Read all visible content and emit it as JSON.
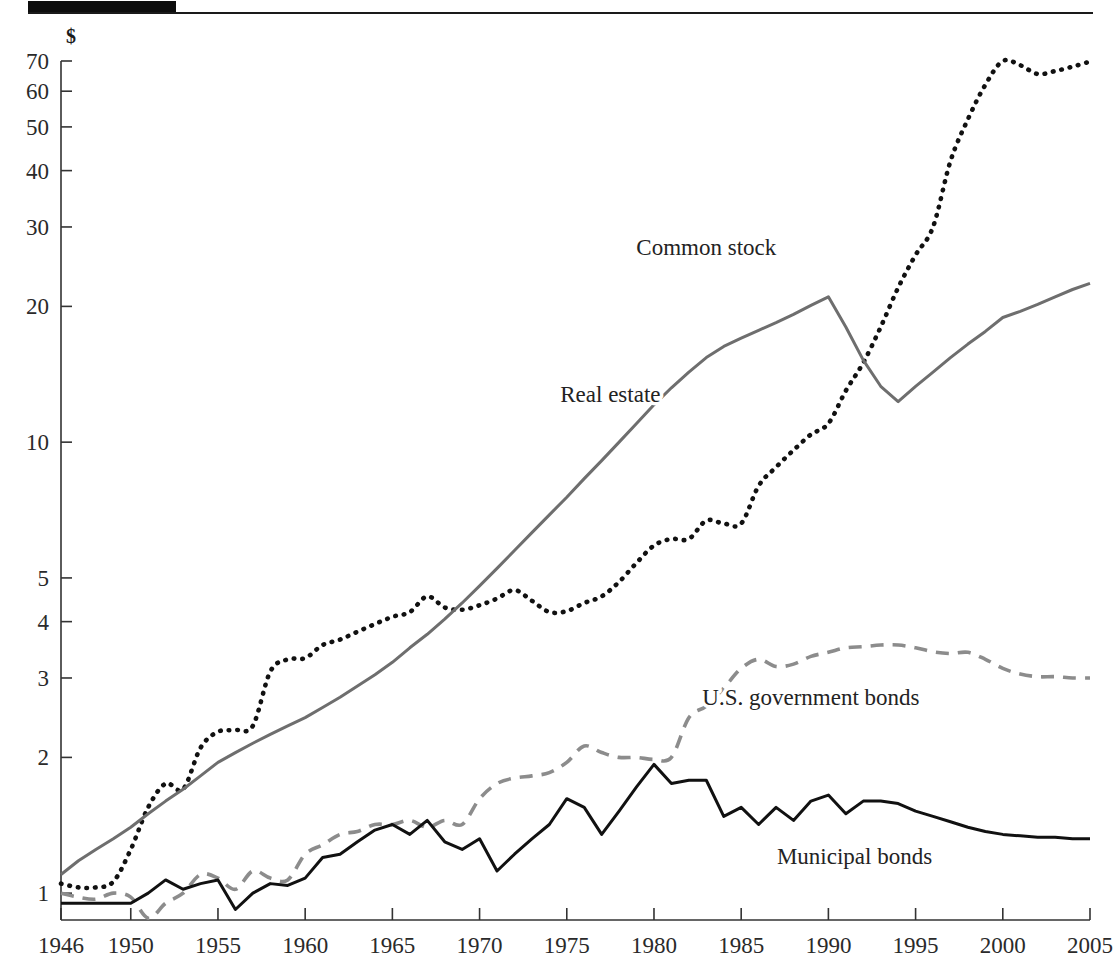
{
  "figure": {
    "background": "#ffffff",
    "rule_color": "#1a1a1a",
    "currency_symbol": "$"
  },
  "chart_data": {
    "type": "line",
    "title": "",
    "subtitle": "",
    "xlabel": "",
    "ylabel": "$",
    "yscale": "log",
    "ylim": [
      0.8,
      75
    ],
    "xlim": [
      1946,
      2005
    ],
    "grid": false,
    "legend_position": "inline-annotations",
    "ytick_labels": [
      "1",
      "2",
      "3",
      "4",
      "5",
      "10",
      "20",
      "30",
      "40",
      "50",
      "60",
      "70"
    ],
    "ytick_values": [
      1,
      2,
      3,
      4,
      5,
      10,
      20,
      30,
      40,
      50,
      60,
      70
    ],
    "xtick_labels": [
      "1946",
      "1950",
      "1955",
      "1960",
      "1965",
      "1970",
      "1975",
      "1980",
      "1985",
      "1990",
      "1995",
      "2000",
      "2005"
    ],
    "xtick_values": [
      1946,
      1950,
      1955,
      1960,
      1965,
      1970,
      1975,
      1980,
      1985,
      1990,
      1995,
      2000,
      2005
    ],
    "x": [
      1946,
      1947,
      1948,
      1949,
      1950,
      1951,
      1952,
      1953,
      1954,
      1955,
      1956,
      1957,
      1958,
      1959,
      1960,
      1961,
      1962,
      1963,
      1964,
      1965,
      1966,
      1967,
      1968,
      1969,
      1970,
      1971,
      1972,
      1973,
      1974,
      1975,
      1976,
      1977,
      1978,
      1979,
      1980,
      1981,
      1982,
      1983,
      1984,
      1985,
      1986,
      1987,
      1988,
      1989,
      1990,
      1991,
      1992,
      1993,
      1994,
      1995,
      1996,
      1997,
      1998,
      1999,
      2000,
      2001,
      2002,
      2003,
      2004,
      2005
    ],
    "series": [
      {
        "name": "Common stock",
        "style": "dotted",
        "color": "#111111",
        "label_x": 1983.0,
        "label_y": 26.0,
        "values": [
          1.05,
          1.03,
          1.03,
          1.06,
          1.25,
          1.55,
          1.75,
          1.7,
          2.1,
          2.28,
          2.3,
          2.35,
          3.1,
          3.3,
          3.32,
          3.55,
          3.65,
          3.8,
          3.95,
          4.1,
          4.2,
          4.55,
          4.3,
          4.25,
          4.35,
          4.5,
          4.7,
          4.45,
          4.2,
          4.22,
          4.4,
          4.55,
          4.9,
          5.4,
          5.9,
          6.1,
          6.1,
          6.7,
          6.6,
          6.6,
          8.0,
          8.8,
          9.6,
          10.4,
          11.0,
          13.0,
          15.0,
          18.0,
          22.0,
          26.0,
          30.0,
          42.0,
          52.0,
          62.0,
          70.0,
          68.5,
          65.5,
          66.5,
          68.0,
          69.8
        ]
      },
      {
        "name": "Real estate",
        "style": "solid",
        "color": "#6e6e6e",
        "label_x": 1977.5,
        "label_y": 12.3,
        "values": [
          1.1,
          1.18,
          1.25,
          1.32,
          1.4,
          1.5,
          1.6,
          1.7,
          1.82,
          1.95,
          2.05,
          2.15,
          2.25,
          2.35,
          2.45,
          2.58,
          2.72,
          2.88,
          3.05,
          3.25,
          3.5,
          3.75,
          4.05,
          4.4,
          4.8,
          5.25,
          5.75,
          6.3,
          6.9,
          7.55,
          8.3,
          9.1,
          10.0,
          11.0,
          12.1,
          13.2,
          14.3,
          15.4,
          16.3,
          17.0,
          17.7,
          18.4,
          19.2,
          20.1,
          21.0,
          18.0,
          15.2,
          13.3,
          12.3,
          13.3,
          14.3,
          15.4,
          16.5,
          17.6,
          18.9,
          19.5,
          20.2,
          21.0,
          21.8,
          22.5
        ]
      },
      {
        "name": "U.S. government bonds",
        "style": "dashed",
        "color": "#8c8c8c",
        "label_x": 1989.0,
        "label_y": 2.62,
        "values": [
          1.0,
          0.98,
          0.97,
          1.0,
          0.98,
          0.88,
          0.95,
          1.0,
          1.1,
          1.08,
          1.02,
          1.12,
          1.08,
          1.07,
          1.22,
          1.28,
          1.35,
          1.37,
          1.42,
          1.42,
          1.45,
          1.4,
          1.45,
          1.42,
          1.62,
          1.75,
          1.8,
          1.82,
          1.85,
          1.95,
          2.12,
          2.05,
          2.0,
          2.0,
          1.98,
          2.0,
          2.45,
          2.6,
          2.85,
          3.15,
          3.3,
          3.18,
          3.22,
          3.35,
          3.42,
          3.5,
          3.52,
          3.55,
          3.55,
          3.5,
          3.43,
          3.4,
          3.42,
          3.3,
          3.15,
          3.06,
          3.02,
          3.02,
          3.0,
          3.0
        ]
      },
      {
        "name": "Municipal bonds",
        "style": "solid",
        "color": "#111111",
        "label_x": 1991.5,
        "label_y": 1.16,
        "values": [
          0.95,
          0.95,
          0.95,
          0.95,
          0.95,
          1.0,
          1.07,
          1.02,
          1.05,
          1.07,
          0.92,
          1.0,
          1.05,
          1.04,
          1.08,
          1.2,
          1.22,
          1.3,
          1.38,
          1.42,
          1.35,
          1.45,
          1.3,
          1.25,
          1.32,
          1.12,
          1.22,
          1.32,
          1.42,
          1.62,
          1.55,
          1.35,
          1.52,
          1.72,
          1.93,
          1.75,
          1.78,
          1.78,
          1.48,
          1.55,
          1.42,
          1.55,
          1.45,
          1.6,
          1.65,
          1.5,
          1.6,
          1.6,
          1.58,
          1.52,
          1.48,
          1.44,
          1.4,
          1.37,
          1.35,
          1.34,
          1.33,
          1.33,
          1.32,
          1.32
        ]
      }
    ]
  }
}
